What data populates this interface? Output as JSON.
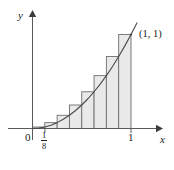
{
  "figure": {
    "axis_labels": {
      "x": "x",
      "y": "y"
    },
    "tick_labels": {
      "origin": "0",
      "x_one": "1",
      "x_fraction_numerator": "1",
      "x_fraction_denominator": "8"
    },
    "annotations": {
      "curve_endpoint": "(1, 1)"
    },
    "colors": {
      "axis": "#555555",
      "curve": "#444444",
      "bar_fill": "#e9e9e9",
      "bar_stroke": "#6e6e6e",
      "text": "#1a1a1a",
      "background": "#ffffff"
    }
  },
  "chart_data": {
    "type": "bar",
    "title": "",
    "subtitle": "",
    "xlabel": "x",
    "ylabel": "y",
    "xlim": [
      0,
      1.125
    ],
    "ylim": [
      0,
      1.18
    ],
    "grid": false,
    "legend": null,
    "function": "y = x^2",
    "n_rectangles": 8,
    "rule": "right endpoint",
    "delta_x": 0.125,
    "categories": [
      "0-1/8",
      "1/8-2/8",
      "2/8-3/8",
      "3/8-4/8",
      "4/8-5/8",
      "5/8-6/8",
      "6/8-7/8",
      "7/8-1"
    ],
    "x_left_edges": [
      0,
      0.125,
      0.25,
      0.375,
      0.5,
      0.625,
      0.75,
      0.875
    ],
    "x_right_edges": [
      0.125,
      0.25,
      0.375,
      0.5,
      0.625,
      0.75,
      0.875,
      1
    ],
    "values": [
      0.015625,
      0.0625,
      0.140625,
      0.25,
      0.390625,
      0.5625,
      0.765625,
      1
    ],
    "series": [
      {
        "name": "y = x^2 (curve)",
        "x": [
          0,
          0.0625,
          0.125,
          0.1875,
          0.25,
          0.3125,
          0.375,
          0.4375,
          0.5,
          0.5625,
          0.625,
          0.6875,
          0.75,
          0.8125,
          0.875,
          0.9375,
          1,
          1.06
        ],
        "values": [
          0,
          0.00390625,
          0.015625,
          0.03515625,
          0.0625,
          0.09765625,
          0.140625,
          0.19140625,
          0.25,
          0.31640625,
          0.390625,
          0.47265625,
          0.5625,
          0.66015625,
          0.765625,
          0.87890625,
          1,
          1.1236
        ]
      }
    ],
    "xticks": [
      0,
      0.125,
      1
    ],
    "xticklabels": [
      "0",
      "1/8",
      "1"
    ],
    "yticks": [],
    "yticklabels": [],
    "annotations": [
      {
        "text": "(1, 1)",
        "x": 1,
        "y": 1
      }
    ]
  }
}
